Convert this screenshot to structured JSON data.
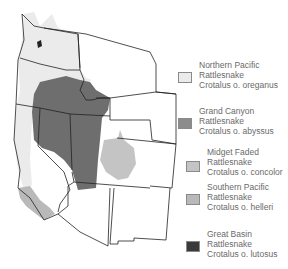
{
  "map": {
    "title": "Western Rattlesnake subspecies range map",
    "colors": {
      "background": "#ffffff",
      "state_fill": "#ffffff",
      "state_border": "#222222",
      "northern_pacific": "#ebebeb",
      "grand_canyon": "#8c8c8c",
      "midget_faded": "#c4c4c4",
      "southern_pacific": "#b9b9b9",
      "great_basin": "#3a3a3a",
      "great_basin_range": "#6e6e6e"
    }
  },
  "legend": {
    "items": [
      {
        "common_line1": "Northern Pacific",
        "common_line2": "Rattlesnake",
        "scientific": "Crotalus o. oreganus",
        "color": "#ebebeb"
      },
      {
        "common_line1": "Grand Canyon",
        "common_line2": "Rattlesnake",
        "scientific": "Crotalus o. abyssus",
        "color": "#8c8c8c"
      },
      {
        "common_line1": "Midget Faded",
        "common_line2": "Rattlesnake",
        "scientific": "Crotalus o. concolor",
        "color": "#c4c4c4"
      },
      {
        "common_line1": "Southern Pacific",
        "common_line2": "Rattlesnake",
        "scientific": "Crotalus o. helleri",
        "color": "#b9b9b9"
      },
      {
        "common_line1": "Great Basin",
        "common_line2": "Rattlesnake",
        "scientific": "Crotalus o. lutosus",
        "color": "#3a3a3a"
      }
    ]
  }
}
